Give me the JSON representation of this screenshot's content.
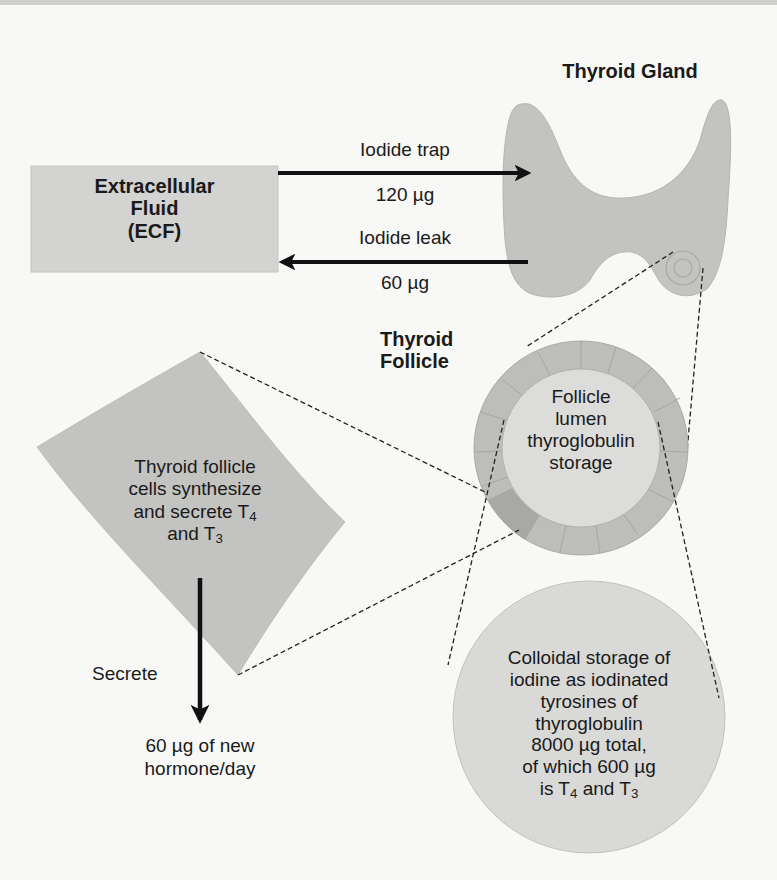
{
  "colors": {
    "background": "#f8f8f6",
    "shape_fill": "#c2c2c0",
    "follicle_ring": "#bcbcba",
    "follicle_ring_dark": "#a9a9a7",
    "lumen_fill": "#dcdcda",
    "colloid_fill": "#d9d9d7",
    "ecf_box_fill": "#d3d3d1",
    "arrow": "#111111"
  },
  "ecf_box": {
    "line1": "Extracellular",
    "line2": "Fluid",
    "line3": "(ECF)"
  },
  "iodide_trap": {
    "label": "Iodide trap",
    "amount": "120 µg"
  },
  "iodide_leak": {
    "label": "Iodide leak",
    "amount": "60 µg"
  },
  "thyroid_gland": {
    "title": "Thyroid Gland"
  },
  "thyroid_follicle": {
    "title_line1": "Thyroid",
    "title_line2": "Follicle",
    "lumen_line1": "Follicle",
    "lumen_line2": "lumen",
    "lumen_line3": "thyroglobulin",
    "lumen_line4": "storage"
  },
  "follicle_cells": {
    "line1": "Thyroid follicle",
    "line2": "cells synthesize",
    "line3_prefix": "and secrete T",
    "line3_sub": "4",
    "line4_prefix": "and T",
    "line4_sub": "3"
  },
  "secrete": {
    "label": "Secrete",
    "output_line1": "60 µg of new",
    "output_line2": "hormone/day"
  },
  "colloid": {
    "line1": "Colloidal storage of",
    "line2": "iodine as iodinated",
    "line3": "tyrosines of",
    "line4": "thyroglobulin",
    "line5": "8000 µg total,",
    "line6": "of which 600 µg",
    "line7_prefix": "is T",
    "line7_sub1": "4",
    "line7_mid": " and T",
    "line7_sub2": "3"
  }
}
